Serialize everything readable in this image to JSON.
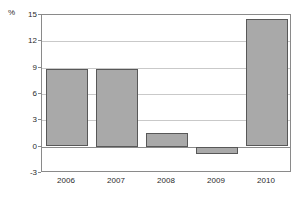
{
  "chart_data": {
    "type": "bar",
    "title": "",
    "subtitle": "",
    "xlabel": "",
    "ylabel": "%",
    "unit_label": "%",
    "categories": [
      "2006",
      "2007",
      "2008",
      "2009",
      "2010"
    ],
    "values": [
      8.8,
      8.9,
      1.6,
      -0.75,
      14.5
    ],
    "series": [
      {
        "name": "",
        "values": [
          8.8,
          8.9,
          1.6,
          -0.75,
          14.5
        ]
      }
    ],
    "ylim": [
      -3,
      15
    ],
    "yticks": [
      15,
      12,
      9,
      6,
      3,
      0,
      -3
    ],
    "ytick_labels": [
      "15",
      "12",
      "9",
      "6",
      "3",
      "0",
      "-3"
    ],
    "grid": true,
    "grid_axis": "y",
    "legend": false,
    "legend_position": "none",
    "bar_fill_color": "#a9a9a9",
    "bar_border_color": "#585858",
    "gridline_color": "#c9c9c9",
    "axis_color": "#8a8a8a",
    "background_color": "#ffffff",
    "text_color": "#2b2b2b"
  }
}
